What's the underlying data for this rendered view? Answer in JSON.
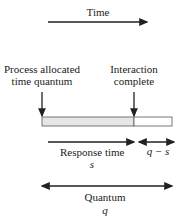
{
  "diagram": {
    "time_axis": {
      "label": "Time"
    },
    "events": [
      {
        "label_line1": "Process allocated",
        "label_line2": "time quantum"
      },
      {
        "label_line1": "Interaction",
        "label_line2": "complete"
      }
    ],
    "bar": {
      "used_color": "#e6e6e6",
      "unused_color": "#ffffff",
      "border_color": "#555555"
    },
    "response": {
      "label": "Response time",
      "symbol": "s"
    },
    "remainder": {
      "symbol": "q − s"
    },
    "quantum": {
      "label": "Quantum",
      "symbol": "q"
    }
  }
}
